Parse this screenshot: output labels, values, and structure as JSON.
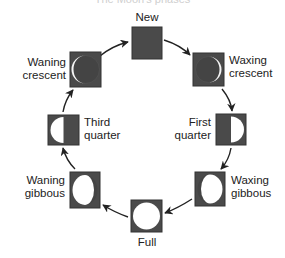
{
  "diagram": {
    "title": "The Moon's phases",
    "colors": {
      "box_fill": "#4a4a4a",
      "box_stroke": "#333333",
      "lit": "#ffffff",
      "arrow": "#222222",
      "text": "#222222"
    },
    "cycle_direction": "clockwise",
    "phases": [
      {
        "id": "new",
        "label": "New"
      },
      {
        "id": "waxing-crescent",
        "label_line1": "Waxing",
        "label_line2": "crescent"
      },
      {
        "id": "first-quarter",
        "label_line1": "First",
        "label_line2": "quarter"
      },
      {
        "id": "waxing-gibbous",
        "label_line1": "Waxing",
        "label_line2": "gibbous"
      },
      {
        "id": "full",
        "label": "Full"
      },
      {
        "id": "waning-gibbous",
        "label_line1": "Waning",
        "label_line2": "gibbous"
      },
      {
        "id": "third-quarter",
        "label_line1": "Third",
        "label_line2": "quarter"
      },
      {
        "id": "waning-crescent",
        "label_line1": "Waning",
        "label_line2": "crescent"
      }
    ]
  }
}
